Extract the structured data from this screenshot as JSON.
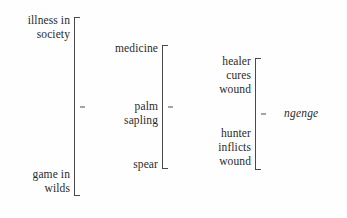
{
  "diagram": {
    "kind": "semantic-bracket-diagram",
    "result_term": "ngenge",
    "ink_color": "#4a4a4a",
    "text_color": "#2b2b2b",
    "background_color": "#fefefe",
    "columns": [
      {
        "index": 1,
        "groups": [
          {
            "id": "illness",
            "lines": [
              "illness in",
              "society"
            ]
          },
          {
            "id": "game",
            "lines": [
              "game in",
              "wilds"
            ]
          }
        ]
      },
      {
        "index": 2,
        "groups": [
          {
            "id": "medicine",
            "lines": [
              "medicine"
            ]
          },
          {
            "id": "palm-sapling",
            "lines": [
              "palm",
              "sapling"
            ]
          },
          {
            "id": "spear",
            "lines": [
              "spear"
            ]
          }
        ]
      },
      {
        "index": 3,
        "groups": [
          {
            "id": "healer",
            "lines": [
              "healer",
              "cures",
              "wound"
            ]
          },
          {
            "id": "hunter",
            "lines": [
              "hunter",
              "inflicts",
              "wound"
            ]
          }
        ]
      }
    ],
    "labels": {
      "illness_line1": "illness in",
      "illness_line2": "society",
      "game_line1": "game in",
      "game_line2": "wilds",
      "medicine_line1": "medicine",
      "palm_line1": "palm",
      "palm_line2": "sapling",
      "spear_line1": "spear",
      "healer_line1": "healer",
      "healer_line2": "cures",
      "healer_line3": "wound",
      "hunter_line1": "hunter",
      "hunter_line2": "inflicts",
      "hunter_line3": "wound",
      "ngenge": "ngenge"
    }
  }
}
